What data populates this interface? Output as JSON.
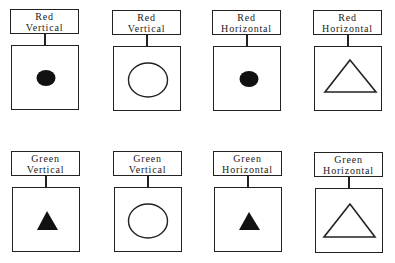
{
  "figure": {
    "rows": [
      {
        "color": "Red",
        "panels": [
          {
            "line1": "Red",
            "line2": "Vertical",
            "shape": "circle",
            "size": "small",
            "fill": "filled"
          },
          {
            "line1": "Red",
            "line2": "Vertical",
            "shape": "circle",
            "size": "large",
            "fill": "outline"
          },
          {
            "line1": "Red",
            "line2": "Horizontal",
            "shape": "circle",
            "size": "small",
            "fill": "filled"
          },
          {
            "line1": "Red",
            "line2": "Horizontal",
            "shape": "triangle",
            "size": "large",
            "fill": "outline"
          }
        ]
      },
      {
        "color": "Green",
        "panels": [
          {
            "line1": "Green",
            "line2": "Vertical",
            "shape": "triangle",
            "size": "small",
            "fill": "filled"
          },
          {
            "line1": "Green",
            "line2": "Vertical",
            "shape": "circle",
            "size": "large",
            "fill": "outline"
          },
          {
            "line1": "Green",
            "line2": "Horizontal",
            "shape": "triangle",
            "size": "small",
            "fill": "filled"
          },
          {
            "line1": "Green",
            "line2": "Horizontal",
            "shape": "triangle",
            "size": "large",
            "fill": "outline"
          }
        ]
      }
    ]
  },
  "colors": {
    "line": "#222222",
    "fill": "#111111",
    "background": "#ffffff"
  }
}
